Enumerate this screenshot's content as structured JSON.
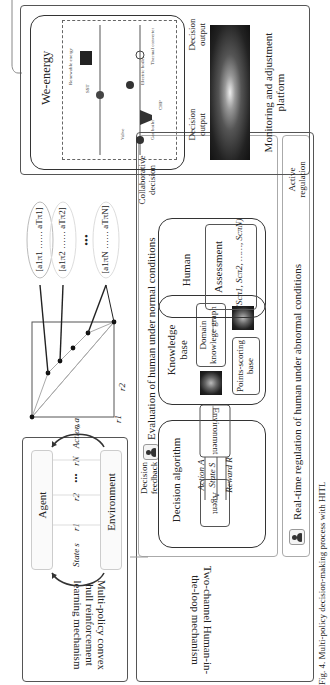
{
  "caption": "Fig. 4. Multi-policy decision-making process with HITL",
  "left_panel": {
    "title": "Multi-policy convex hull reinforcement learning mechanism",
    "agent_label": "Agent",
    "environment_label": "Environment",
    "state_label": "State s",
    "action_label": "Action a",
    "rewards": [
      "r1",
      "r2",
      "•••",
      "rN"
    ],
    "plot_axis_x": "r1",
    "plot_axis_y": "r2",
    "policy_sets": [
      "[a1π1 …… aTπ1]",
      "[a1π2 …… aTπ2]",
      "•••",
      "[a1πN …… aTπN]"
    ]
  },
  "middle_panel": {
    "title": "Two-channel Human-in-the-loop mechanism",
    "normal_section_title": "Evaluation of human under normal conditions",
    "feedback_label": "Decision feedback",
    "decision_algorithm": {
      "title": "Decision algorithm",
      "agent": "Agent",
      "environment": "Environment",
      "action": "Action A",
      "state": "State S",
      "reward": "Reward R"
    },
    "knowledge_base": {
      "title": "Knowledge base",
      "domain_graph": "Domain knowlege graph",
      "points_base": "Points-scoring base"
    },
    "human": {
      "title": "Human",
      "assessment": "Assessment",
      "scores": "(Scπ1, Scπ2, ……, ScπN)"
    },
    "abnormal_section_title": "Real-time regulation of human under abnormal conditions"
  },
  "right_panel": {
    "we_energy_title": "We-energy",
    "components": [
      "SST",
      "Renewable energy",
      "Electric boiler",
      "Thermal converter",
      "Valve",
      "Gas boiler",
      "CHP"
    ],
    "decision_output_1": "Decision output",
    "decision_output_2": "Decision output",
    "platform_title": "Monitoring and adjustment platform"
  },
  "connectors": {
    "collaborative": "Collaborative decision",
    "active": "Active regulation"
  }
}
